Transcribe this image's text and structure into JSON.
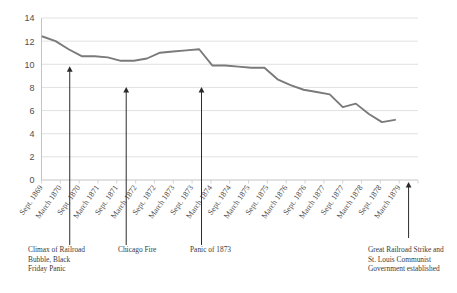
{
  "chart_data": {
    "type": "line",
    "title": "",
    "xlabel": "",
    "ylabel": "",
    "ylim": [
      0,
      14
    ],
    "ytick_step": 2,
    "yticks": [
      0,
      2,
      4,
      6,
      8,
      10,
      12,
      14
    ],
    "grid": true,
    "legend": "none",
    "line_color": "#7a7a7a",
    "categories": [
      "Sept. 1869",
      "March 1870",
      "Sept. 1870",
      "March 1871",
      "Sept. 1871",
      "March 1872",
      "Sept. 1872",
      "March 1873",
      "Sept. 1873",
      "March 1874",
      "Sept. 1874",
      "March 1875",
      "Sept. 1875",
      "March 1876",
      "Sept. 1876",
      "March 1877",
      "Sept. 1877",
      "March 1878",
      "Sept. 1878",
      "March 1879"
    ],
    "values": [
      12.4,
      12.0,
      11.3,
      10.7,
      10.7,
      10.6,
      10.3,
      10.3,
      10.5,
      11.0,
      11.1,
      11.2,
      11.3,
      9.9,
      9.9,
      9.8,
      9.7,
      9.7,
      8.7,
      8.2
    ],
    "values_tail": [
      7.8,
      7.6,
      7.4,
      6.3,
      6.6,
      5.7,
      5.0,
      5.2
    ],
    "annotations": [
      {
        "id": "annot-1",
        "lines": [
          "Climax of Railroad",
          "Bubble, Black",
          "Friday Panic"
        ],
        "anchor_category": "March 1870",
        "arrow_tip_value": 10.0
      },
      {
        "id": "annot-2",
        "lines": [
          "Chicago Fire"
        ],
        "anchor_category": "Sept. 1871",
        "arrow_tip_value": 8.2
      },
      {
        "id": "annot-3",
        "lines": [
          "Panic of 1873"
        ],
        "anchor_category": "Sept. 1873",
        "arrow_tip_value": 8.2
      },
      {
        "id": "annot-4",
        "lines": [
          "Great Railroad Strike and",
          "St. Louis Communist",
          "Government established"
        ],
        "anchor_category": "March 1879",
        "arrow_tip_value": 0.0
      }
    ]
  }
}
